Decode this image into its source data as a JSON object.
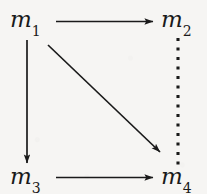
{
  "figure": {
    "kind": "commutative-diagram",
    "background_color": "#f6f5f3",
    "ink_color": "#1a1a1a"
  },
  "nodes": [
    {
      "id": "m1",
      "base": "m",
      "subscript": "1",
      "text": "m1",
      "position": "top-left"
    },
    {
      "id": "m2",
      "base": "m",
      "subscript": "2",
      "text": "m2",
      "position": "top-right"
    },
    {
      "id": "m3",
      "base": "m",
      "subscript": "3",
      "text": "m3",
      "position": "bottom-left"
    },
    {
      "id": "m4",
      "base": "m",
      "subscript": "4",
      "text": "m4",
      "position": "bottom-right"
    }
  ],
  "edges": [
    {
      "id": "m1-to-m2",
      "from": "m1",
      "to": "m2",
      "style": "solid",
      "arrowhead": "end",
      "orientation": "horizontal",
      "label": ""
    },
    {
      "id": "m1-to-m3",
      "from": "m1",
      "to": "m3",
      "style": "solid",
      "arrowhead": "end",
      "orientation": "vertical",
      "label": ""
    },
    {
      "id": "m1-to-m4",
      "from": "m1",
      "to": "m4",
      "style": "solid",
      "arrowhead": "end",
      "orientation": "diagonal",
      "label": ""
    },
    {
      "id": "m3-to-m4",
      "from": "m3",
      "to": "m4",
      "style": "solid",
      "arrowhead": "end",
      "orientation": "horizontal",
      "label": ""
    },
    {
      "id": "m2-to-m4",
      "from": "m2",
      "to": "m4",
      "style": "dotted",
      "arrowhead": "none",
      "orientation": "vertical",
      "label": ""
    }
  ]
}
